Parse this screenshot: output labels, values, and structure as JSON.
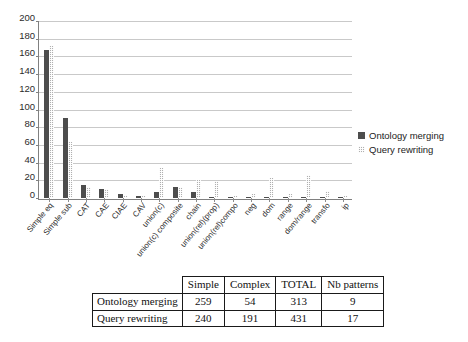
{
  "chart_data": {
    "type": "bar",
    "title": "",
    "xlabel": "",
    "ylabel": "",
    "ylim": [
      0,
      200
    ],
    "yticks": [
      0,
      20,
      40,
      60,
      80,
      100,
      120,
      140,
      160,
      180,
      200
    ],
    "grid": true,
    "legend_position": "right",
    "categories": [
      "Simple eq",
      "Simple sub",
      "CAT",
      "CAE",
      "CIAE",
      "CAV",
      "union(c)",
      "union(c) composite",
      "chain",
      "union(rel)(prop)",
      "union(rel)compo",
      "neg",
      "dom",
      "range",
      "dom/range",
      "transfo",
      "ip"
    ],
    "series": [
      {
        "name": "Ontology merging",
        "color": "#4d4d4d",
        "values": [
          168,
          91,
          15,
          10,
          4,
          2,
          7,
          12,
          7,
          0,
          0,
          0,
          0,
          0,
          0,
          0,
          0
        ]
      },
      {
        "name": "Query rewriting",
        "color": "#b0b0b0",
        "values": [
          173,
          64,
          13,
          10,
          3,
          2,
          34,
          12,
          21,
          19,
          2,
          5,
          23,
          4,
          26,
          8,
          2
        ]
      }
    ]
  },
  "legend": {
    "items": [
      {
        "label": "Ontology merging",
        "swatch": "series-0-swatch"
      },
      {
        "label": "Query rewriting",
        "swatch": "series-1-swatch"
      }
    ]
  },
  "table": {
    "corner": "",
    "columns": [
      "Simple",
      "Complex",
      "TOTAL",
      "Nb patterns"
    ],
    "rows": [
      {
        "label": "Ontology merging",
        "cells": [
          "259",
          "54",
          "313",
          "9"
        ]
      },
      {
        "label": "Query rewriting",
        "cells": [
          "240",
          "191",
          "431",
          "17"
        ]
      }
    ]
  }
}
